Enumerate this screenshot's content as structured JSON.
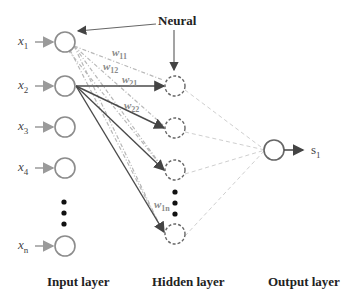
{
  "diagram": {
    "callout_label": "Neural",
    "inputs": [
      {
        "base": "x",
        "sub": "1"
      },
      {
        "base": "x",
        "sub": "2"
      },
      {
        "base": "x",
        "sub": "3"
      },
      {
        "base": "x",
        "sub": "4"
      },
      {
        "base": "x",
        "sub": "n"
      }
    ],
    "weights": [
      {
        "base": "w",
        "sub": "11"
      },
      {
        "base": "w",
        "sub": "12"
      },
      {
        "base": "w",
        "sub": "21"
      },
      {
        "base": "w",
        "sub": "22"
      },
      {
        "base": "w",
        "sub": "1n"
      }
    ],
    "output": {
      "base": "s",
      "sub": "1"
    },
    "layers": {
      "input": "Input layer",
      "hidden": "Hidden layer",
      "output": "Output layer"
    },
    "colors": {
      "node_stroke": "#8c8c8c",
      "solid_edge": "#4a4a4a",
      "dashed_edge": "#bdbdbd",
      "weight_text": "#8a8a8a"
    }
  }
}
